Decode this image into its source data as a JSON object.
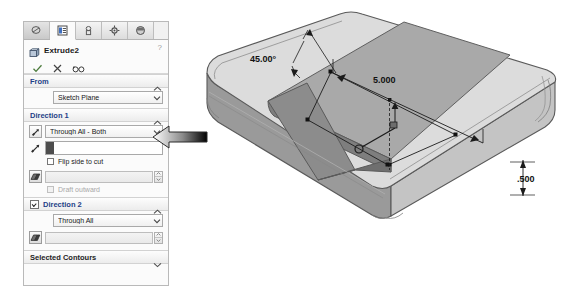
{
  "panel": {
    "tabs": [
      {
        "name": "feature-manager-tree-tab",
        "icon": "tree-icon"
      },
      {
        "name": "property-manager-tab",
        "icon": "list-icon"
      },
      {
        "name": "configuration-manager-tab",
        "icon": "configuration-icon"
      },
      {
        "name": "dimxpert-manager-tab",
        "icon": "target-icon"
      },
      {
        "name": "display-manager-tab",
        "icon": "sphere-icon"
      }
    ],
    "feature": {
      "title": "Extrude2",
      "icon": "extrude-feature-icon",
      "help_label": "?"
    },
    "actions": [
      {
        "name": "ok-button",
        "icon": "check-icon"
      },
      {
        "name": "cancel-button",
        "icon": "x-icon"
      },
      {
        "name": "detailed-preview-button",
        "icon": "glasses-icon"
      }
    ],
    "groups": {
      "from": {
        "title": "From",
        "collapse_icon": "chevron-up-icon",
        "start_condition": "Sketch Plane"
      },
      "direction1": {
        "title": "Direction 1",
        "collapse_icon": "chevron-up-icon",
        "reverse_icon": "reverse-direction-icon",
        "end_condition": "Through All - Both",
        "direction_vector_value": "",
        "flip_side_label": "Flip side to cut",
        "flip_side_checked": false,
        "draft_icon": "draft-angle-icon",
        "draft_value": "",
        "draft_outward_label": "Draft outward",
        "draft_outward_checked": false,
        "draft_enabled": false
      },
      "direction2": {
        "title": "Direction 2",
        "enabled": true,
        "collapse_icon": "chevron-up-icon",
        "end_condition": "Through All",
        "draft_icon": "draft-angle-icon",
        "draft_value": "",
        "draft_enabled": false
      },
      "selected_contours": {
        "title": "Selected Contours",
        "collapse_icon": "chevron-down-icon"
      }
    }
  },
  "callout": {
    "name": "annotation-arrow",
    "direction": "left"
  },
  "viewport": {
    "name": "graphics-area",
    "model": "rectangular-block-with-cut",
    "dimensions": [
      {
        "name": "angle-dimension",
        "value": "45.00°"
      },
      {
        "name": "length-dimension",
        "value": "5.000"
      },
      {
        "name": "depth-dimension",
        "value": ".500"
      }
    ],
    "colors": {
      "model_light": "#d8d8d8",
      "model_mid": "#c2c2c2",
      "model_dark": "#9e9e9e",
      "model_cut": "#8e8e8e",
      "outline": "#5a5a5a"
    }
  }
}
